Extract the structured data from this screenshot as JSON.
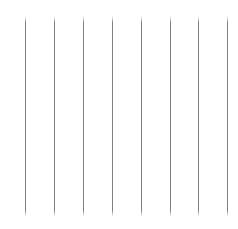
{
  "canvas": {
    "width": 238,
    "height": 229,
    "background_color": "#ffffff"
  },
  "graphic": {
    "kind": "vertical-rule-pattern",
    "description": "Eight evenly spaced thin vertical gray lines on a plain white background",
    "line_count": 8,
    "line_color": "#808080",
    "line_width_px": 1,
    "line_top_y_px": 16,
    "line_bottom_y_px": 217,
    "line_length_px": 201,
    "line_spacing_px": 28.8,
    "fade_ends": true,
    "lines": [
      {
        "index": 1,
        "x_px": 25,
        "top_px": 16,
        "bottom_px": 217
      },
      {
        "index": 2,
        "x_px": 54,
        "top_px": 16,
        "bottom_px": 217
      },
      {
        "index": 3,
        "x_px": 83,
        "top_px": 16,
        "bottom_px": 217
      },
      {
        "index": 4,
        "x_px": 112,
        "top_px": 16,
        "bottom_px": 217
      },
      {
        "index": 5,
        "x_px": 141,
        "top_px": 16,
        "bottom_px": 217
      },
      {
        "index": 6,
        "x_px": 170,
        "top_px": 16,
        "bottom_px": 217
      },
      {
        "index": 7,
        "x_px": 198,
        "top_px": 16,
        "bottom_px": 217
      },
      {
        "index": 8,
        "x_px": 227,
        "top_px": 16,
        "bottom_px": 217
      }
    ]
  }
}
